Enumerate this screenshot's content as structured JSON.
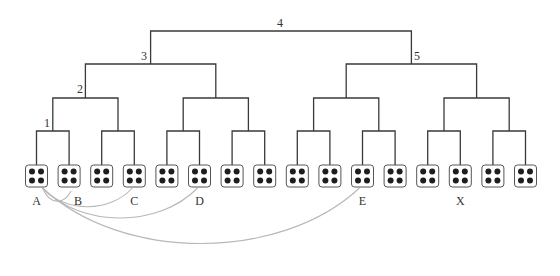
{
  "diagram": {
    "type": "binary-tree",
    "colors": {
      "tree_line": "#3a3a3a",
      "box_border": "#555555",
      "pip": "#1e1e1e",
      "arc": "#b8b8b8",
      "label": "#333333"
    },
    "level_labels": [
      {
        "text": "1",
        "x": 47,
        "y": 127
      },
      {
        "text": "2",
        "x": 80,
        "y": 93
      },
      {
        "text": "3",
        "x": 144,
        "y": 60
      },
      {
        "text": "4",
        "x": 280,
        "y": 27
      },
      {
        "text": "5",
        "x": 417,
        "y": 60
      }
    ],
    "leaf_count": 16,
    "leaf_labels": [
      {
        "text": "A",
        "leaf_index": 0
      },
      {
        "text": "B",
        "leaf_index": 1,
        "dx": 9
      },
      {
        "text": "C",
        "leaf_index": 3
      },
      {
        "text": "D",
        "leaf_index": 5
      },
      {
        "text": "E",
        "leaf_index": 10
      },
      {
        "text": "X",
        "leaf_index": 13
      }
    ],
    "arcs": [
      {
        "from": "A",
        "to": "B"
      },
      {
        "from": "A",
        "to": "C"
      },
      {
        "from": "A",
        "to": "D"
      },
      {
        "from": "A",
        "to": "E"
      }
    ]
  }
}
